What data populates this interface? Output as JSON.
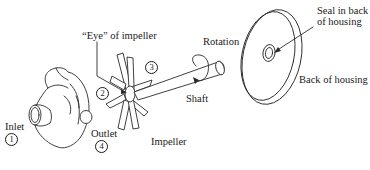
{
  "diagram": {
    "type": "exploded-view",
    "labels": {
      "eye": "“Eye” of impeller",
      "rotation": "Rotation",
      "shaft": "Shaft",
      "impeller": "Impeller",
      "inlet": "Inlet",
      "outlet": "Outlet",
      "seal": "Seal in back of housing",
      "back_housing": "Back of housing"
    },
    "stations": {
      "s1": "1",
      "s2": "2",
      "s3": "3",
      "s4": "4"
    },
    "components": [
      "Front housing (volute) with inlet and outlet",
      "Impeller with eye",
      "Shaft",
      "Back of housing with seal"
    ],
    "colors": {
      "line": "#2a2a2a",
      "background": "#ffffff"
    }
  }
}
